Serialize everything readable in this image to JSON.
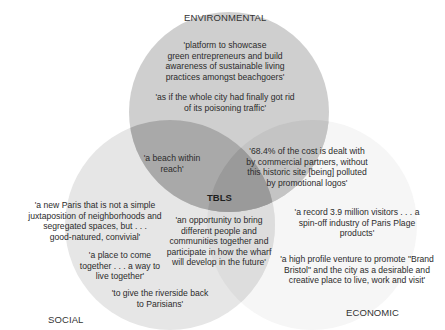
{
  "diagram": {
    "type": "venn-3",
    "center_label": "TBLS",
    "sets": {
      "environmental": {
        "label": "ENVIRONMENTAL",
        "color": "#cfcfcf"
      },
      "social": {
        "label": "SOCIAL",
        "color": "#e6e6e6"
      },
      "economic": {
        "label": "ECONOMIC",
        "color": "#f6f6f6"
      }
    },
    "region_colors": {
      "env_social": "#a9a9a9",
      "env_economic": "#c4c4c4",
      "social_economic": "#dddddd",
      "all": "#9a9a9a"
    },
    "quotes": {
      "env_1": "'platform to showcase green entrepreneurs and build awareness of sustainable living practices amongst beachgoers'",
      "env_2": "'as if the whole city had finally got rid of its poisoning traffic'",
      "env_social": "'a beach within reach'",
      "env_economic": "'68.4% of the cost is dealt with by commercial partners, without this historic site [being] polluted by promotional logos'",
      "social_1": "'a new Paris that is not a simple juxtaposition of neighborhoods and segregated spaces, but . . . good-natured, convivial'",
      "social_2": "'a place to come together . . . a way to live together'",
      "social_3": "'to give the riverside back to Parisians'",
      "social_economic": "'an opportunity to bring different people and communities together and participate in how the wharf will develop in the future'",
      "economic_1": "'a record 3.9 million visitors . . . a spin-off industry of Paris Plage products'",
      "economic_2": "'a high profile venture to promote \"Brand Bristol\" and the city as a desirable and creative place to live, work and visit'"
    },
    "quote_lines": {
      "env_1": [
        "'platform to showcase",
        "green entrepreneurs and build",
        "awareness of sustainable living",
        "practices amongst beachgoers'"
      ],
      "env_2": [
        "'as if the whole city had finally got rid",
        "of its poisoning traffic'"
      ],
      "env_social": [
        "'a beach within",
        "reach'"
      ],
      "env_economic": [
        "'68.4% of the cost is dealt with",
        "by commercial partners, without",
        "this historic site [being] polluted",
        "by promotional logos'"
      ],
      "social_1": [
        "'a new Paris that is not a simple",
        "juxtaposition of neighborhoods and",
        "segregated spaces, but . . .",
        "good-natured, convivial'"
      ],
      "social_2": [
        "'a place to come",
        "together . . . a way to",
        "live together'"
      ],
      "social_3": [
        "'to give the riverside back",
        "to Parisians'"
      ],
      "social_economic": [
        "'an opportunity to bring",
        "different people and",
        "communities together and",
        "participate in how the wharf",
        "will develop in the future'"
      ],
      "economic_1": [
        "'a record 3.9 million visitors . . . a",
        "spin-off industry of Paris Plage",
        "products'"
      ],
      "economic_2": [
        "'a high profile venture to promote \"Brand",
        "Bristol\" and the city as a desirable and",
        "creative place to live, work and visit'"
      ]
    }
  }
}
